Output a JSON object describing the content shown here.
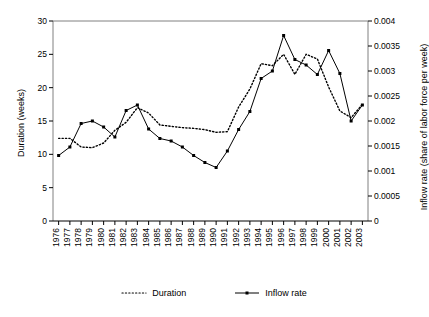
{
  "chart_data": {
    "type": "line",
    "title": "",
    "xlabel": "",
    "ylabel": "Duration (weeks)",
    "y2label": "Inflow rate (share of labor force per week)",
    "grid": false,
    "legend_position": "bottom-center",
    "ylim": [
      0,
      30
    ],
    "y2lim": [
      0,
      0.004
    ],
    "yticks": [
      0,
      5,
      10,
      15,
      20,
      25,
      30
    ],
    "y2ticks": [
      0,
      0.0005,
      0.001,
      0.0015,
      0.002,
      0.0025,
      0.003,
      0.0035,
      0.004
    ],
    "ytick_labels": [
      "0",
      "5",
      "10",
      "15",
      "20",
      "25",
      "30"
    ],
    "y2tick_labels": [
      "0",
      "0.0005",
      "0.001",
      "0.0015",
      "0.002",
      "0.0025",
      "0.003",
      "0.0035",
      "0.004"
    ],
    "categories": [
      "1976",
      "1977",
      "1978",
      "1979",
      "1980",
      "1981",
      "1982",
      "1983",
      "1984",
      "1985",
      "1986",
      "1987",
      "1988",
      "1989",
      "1990",
      "1991",
      "1992",
      "1993",
      "1994",
      "1995",
      "1996",
      "1997",
      "1998",
      "1999",
      "2000",
      "2001",
      "2002",
      "2003"
    ],
    "series": [
      {
        "name": "Duration",
        "axis": "left",
        "unit": "weeks",
        "style": "dotted",
        "marker": "none",
        "color": "#000000",
        "values": [
          12.4,
          12.4,
          11.1,
          11.0,
          11.7,
          13.6,
          14.8,
          17.0,
          16.2,
          14.4,
          14.2,
          14.0,
          13.9,
          13.7,
          13.3,
          13.4,
          17.1,
          19.8,
          23.6,
          23.3,
          25.0,
          22.0,
          25.0,
          24.3,
          20.1,
          16.5,
          15.5,
          17.5
        ]
      },
      {
        "name": "Inflow rate",
        "axis": "right",
        "unit": "share of labor force per week",
        "style": "solid",
        "marker": "square",
        "color": "#000000",
        "values_weeks_scale": [
          9.8,
          11.1,
          14.6,
          15.0,
          14.1,
          12.6,
          16.6,
          17.4,
          13.8,
          12.4,
          12.0,
          11.1,
          9.8,
          8.8,
          8.0,
          10.5,
          13.7,
          16.4,
          21.4,
          22.5,
          27.8,
          24.2,
          23.4,
          22.0,
          25.6,
          22.1,
          15.0,
          17.4
        ],
        "values": [
          0.00131,
          0.00148,
          0.00195,
          0.002,
          0.00188,
          0.00168,
          0.00221,
          0.00232,
          0.00184,
          0.00165,
          0.0016,
          0.00148,
          0.00131,
          0.00117,
          0.00107,
          0.0014,
          0.00183,
          0.00219,
          0.00285,
          0.003,
          0.00371,
          0.00323,
          0.00312,
          0.00293,
          0.00341,
          0.00295,
          0.002,
          0.00232
        ]
      }
    ],
    "legend": [
      {
        "label": "Duration",
        "style": "dotted",
        "marker": "none"
      },
      {
        "label": "Inflow rate",
        "style": "solid",
        "marker": "square"
      }
    ]
  }
}
